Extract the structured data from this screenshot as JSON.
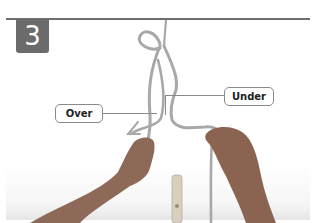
{
  "step": {
    "number": "3"
  },
  "callouts": {
    "over": "Over",
    "under": "Under"
  },
  "colors": {
    "badge": "#6b6b6b",
    "rule": "#6e6e6e",
    "rope": "#a9a9a9",
    "skin": "#8d6a58",
    "background_floor": "#ececec"
  }
}
